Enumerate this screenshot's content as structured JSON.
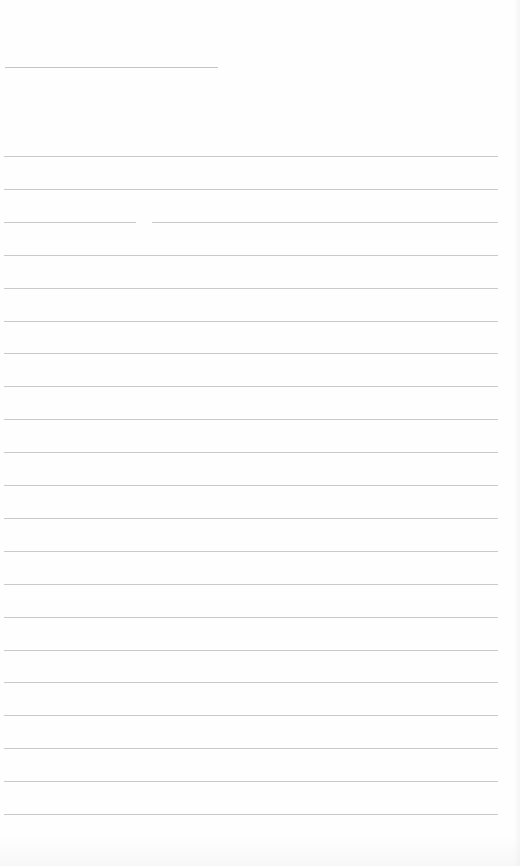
{
  "page": {
    "type": "blank lined paper",
    "background": "#fefefe",
    "line_color": "#c9c9c9",
    "header_line": {
      "top": 67,
      "left": 5,
      "width": 213
    },
    "ruled_lines": {
      "count": 21,
      "first_top": 156,
      "spacing": 32.9,
      "left": 4,
      "right": 498
    },
    "text": []
  }
}
